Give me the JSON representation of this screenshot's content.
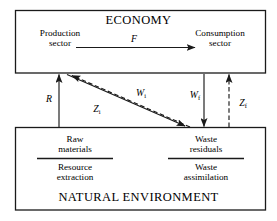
{
  "diagram": {
    "title_top": "ECONOMY",
    "title_bottom": "NATURAL ENVIRONMENT",
    "economy": {
      "production_line1": "Production",
      "production_line2": "sector",
      "consumption_line1": "Consumption",
      "consumption_line2": "sector"
    },
    "environment": {
      "raw_line1": "Raw",
      "raw_line2": "materials",
      "resource_line1": "Resource",
      "resource_line2": "extraction",
      "waste_line1": "Waste",
      "waste_line2": "residuals",
      "assim_line1": "Waste",
      "assim_line2": "assimilation"
    },
    "flows": {
      "F": "F",
      "R": "R",
      "Wi_base": "W",
      "Wi_sub": "i",
      "Wf_base": "W",
      "Wf_sub": "f",
      "Zi_base": "Z",
      "Zi_sub": "i",
      "Zf_base": "Z",
      "Zf_sub": "f"
    },
    "colors": {
      "stroke": "#1a1a1a",
      "background": "#ffffff",
      "text": "#000000"
    }
  }
}
